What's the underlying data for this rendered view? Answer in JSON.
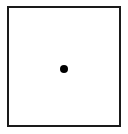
{
  "diagram": {
    "shapes": [
      {
        "type": "square",
        "stroke": "#1a1a1a",
        "fill": "#ffffff"
      },
      {
        "type": "dot",
        "position": "center",
        "fill": "#000000"
      }
    ]
  }
}
